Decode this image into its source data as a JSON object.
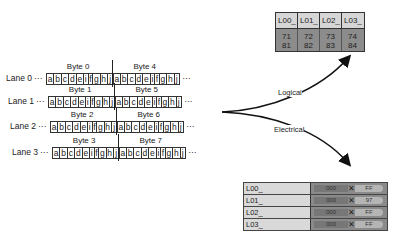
{
  "lanes": [
    {
      "label": "Lane 0",
      "dots": "···",
      "bytes": [
        "Byte 0",
        "Byte 4"
      ]
    },
    {
      "label": "Lane 1",
      "dots": "···",
      "bytes": [
        "Byte 1",
        "Byte 5"
      ]
    },
    {
      "label": "Lane 2",
      "dots": "···",
      "bytes": [
        "Byte 2",
        "Byte 6"
      ]
    },
    {
      "label": "Lane 3",
      "dots": "···",
      "bytes": [
        "Byte 3",
        "Byte 7"
      ]
    }
  ],
  "bit_symbols": [
    "a",
    "b",
    "c",
    "d",
    "e",
    "i",
    "f",
    "g",
    "h",
    "j"
  ],
  "trailing_dots": "···",
  "arrows": {
    "logical_label": "Logical",
    "electrical_label": "Electrical"
  },
  "logical_view": {
    "headers": [
      "L00_",
      "L01_",
      "L02_",
      "L03_"
    ],
    "rows": [
      [
        "71",
        "72",
        "73",
        "74"
      ],
      [
        "81",
        "82",
        "83",
        "84"
      ]
    ]
  },
  "electrical_view": {
    "rows": [
      {
        "name": "L00_",
        "value_a": "000",
        "value_b": "FF"
      },
      {
        "name": "L01_",
        "value_a": "000",
        "value_b": "97"
      },
      {
        "name": "L02_",
        "value_a": "000",
        "value_b": "FF"
      },
      {
        "name": "L03_",
        "value_a": "000",
        "value_b": "FF"
      }
    ]
  }
}
